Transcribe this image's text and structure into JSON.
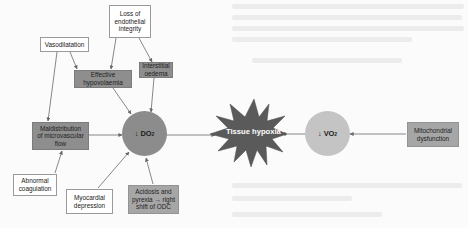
{
  "diagram": {
    "type": "flowchart",
    "central_node": {
      "id": "tissue_hypoxia",
      "label": "Tissue hypoxia",
      "shape": "star",
      "color": "#5a5a5a"
    },
    "nodes": [
      {
        "id": "loss_endothelial",
        "label": "Loss of endothelial integrity",
        "style": "white"
      },
      {
        "id": "vasodilatation",
        "label": "Vasodilatation",
        "style": "white"
      },
      {
        "id": "effective_hypovolaemia",
        "label": "Effective hypovolaemia",
        "style": "gray"
      },
      {
        "id": "interstitial_oedema",
        "label": "Interstitial oedema",
        "style": "gray"
      },
      {
        "id": "maldistribution",
        "label": "Maldistribution of microvascular flow",
        "style": "gray"
      },
      {
        "id": "abnormal_coagulation",
        "label": "Abnormal coagulation",
        "style": "white"
      },
      {
        "id": "myocardial_depression",
        "label": "Myocardial depression",
        "style": "white"
      },
      {
        "id": "acidosis_pyrexia",
        "label": "Acidosis and pyrexia → right shift of ODC",
        "style": "gray"
      },
      {
        "id": "mitochondrial_dysfunction",
        "label": "Mitochondrial dysfunction",
        "style": "gray"
      }
    ],
    "do2": {
      "arrow": "↓",
      "main": "DO",
      "sub": "2",
      "color": "#8c8c8c"
    },
    "vo2": {
      "arrow": "↓",
      "main": "VO",
      "sub": "2",
      "color": "#c4c4c4"
    },
    "edges": [
      [
        "loss_endothelial",
        "effective_hypovolaemia"
      ],
      [
        "loss_endothelial",
        "interstitial_oedema"
      ],
      [
        "vasodilatation",
        "effective_hypovolaemia"
      ],
      [
        "vasodilatation",
        "maldistribution"
      ],
      [
        "effective_hypovolaemia",
        "do2"
      ],
      [
        "interstitial_oedema",
        "do2"
      ],
      [
        "maldistribution",
        "do2"
      ],
      [
        "abnormal_coagulation",
        "maldistribution"
      ],
      [
        "myocardial_depression",
        "do2"
      ],
      [
        "acidosis_pyrexia",
        "do2"
      ],
      [
        "do2",
        "tissue_hypoxia"
      ],
      [
        "vo2",
        "tissue_hypoxia"
      ],
      [
        "mitochondrial_dysfunction",
        "vo2"
      ]
    ]
  },
  "labels": {
    "loss_endothelial": [
      "Loss of",
      "endothelial",
      "integrity"
    ],
    "vasodilatation": [
      "Vasodilatation"
    ],
    "effective_hypovolaemia": [
      "Effective",
      "hypovolaemia"
    ],
    "interstitial_oedema": [
      "Interstitial",
      "oedema"
    ],
    "maldistribution": [
      "Maldistribution",
      "of microvascular",
      "flow"
    ],
    "abnormal_coagulation": [
      "Abnormal",
      "coagulation"
    ],
    "myocardial_depression": [
      "Myocardial",
      "depression"
    ],
    "acidosis_pyrexia": [
      "Acidosis and",
      "pyrexia → right",
      "shift of ODC"
    ],
    "mitochondrial_dysfunction": [
      "Mitochondrial",
      "dysfunction"
    ],
    "tissue_hypoxia": "Tissue hypoxia"
  }
}
